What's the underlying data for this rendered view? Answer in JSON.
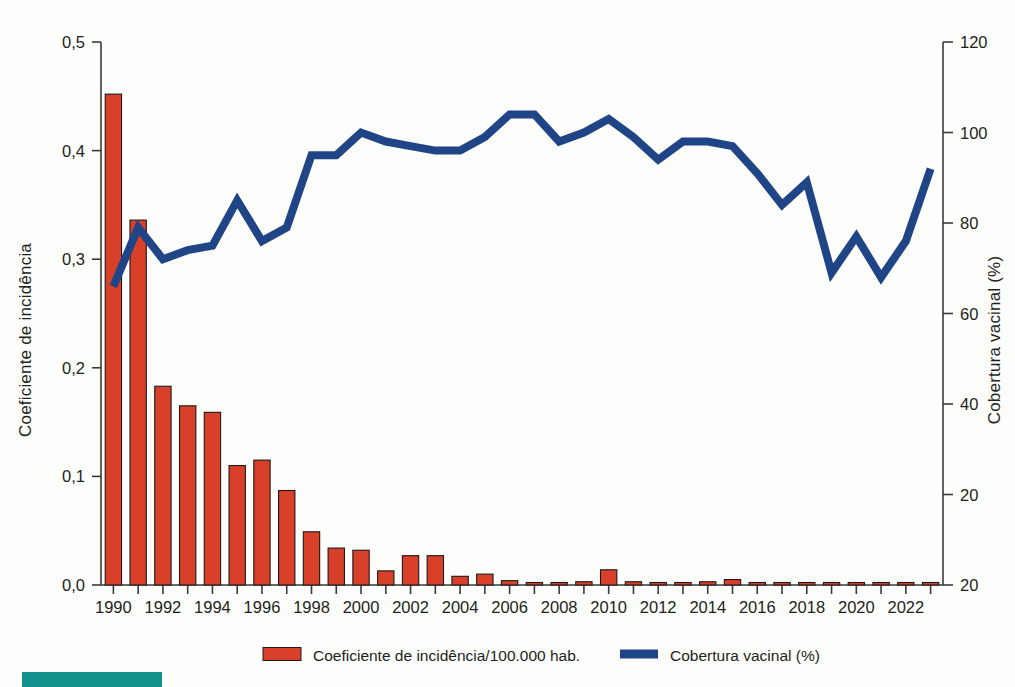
{
  "colors": {
    "bar": "#D8402A",
    "line": "#1F4587",
    "axis": "#3a3a3a",
    "text": "#231f20",
    "accent_teal": "#13918C",
    "background": "#fdfdfb"
  },
  "legend": {
    "position": "bottom",
    "items": [
      {
        "label": "Coeficiente de incidência/100.000 hab.",
        "type": "bar",
        "color": "#D8402A"
      },
      {
        "label": "Cobertura vacinal (%)",
        "type": "line",
        "color": "#1F4587"
      }
    ]
  },
  "chart_data": {
    "type": "bar",
    "title": "",
    "subtitle": "",
    "xlabel": "",
    "ylabel": "Coeficiente de incidência",
    "y2label": "Cobertura vacinal (%)",
    "grid": false,
    "ylim": [
      0.0,
      0.5
    ],
    "y2lim": [
      0,
      120
    ],
    "yticks": [
      0.0,
      0.1,
      0.2,
      0.3,
      0.4,
      0.5
    ],
    "ytick_labels": [
      "0,0",
      "0,1",
      "0,2",
      "0,3",
      "0,4",
      "0,5"
    ],
    "y2ticks": [
      0,
      20,
      40,
      60,
      80,
      100,
      120
    ],
    "y2tick_labels": [
      "20",
      "20",
      "40",
      "60",
      "80",
      "100",
      "120"
    ],
    "xlim": [
      1989.5,
      2023.5
    ],
    "categories": [
      1990,
      1991,
      1992,
      1993,
      1994,
      1995,
      1996,
      1997,
      1998,
      1999,
      2000,
      2001,
      2002,
      2003,
      2004,
      2005,
      2006,
      2007,
      2008,
      2009,
      2010,
      2011,
      2012,
      2013,
      2014,
      2015,
      2016,
      2017,
      2018,
      2019,
      2020,
      2021,
      2022,
      2023
    ],
    "xtick_labels": [
      "1990",
      "1992",
      "1994",
      "1996",
      "1998",
      "2000",
      "2002",
      "2004",
      "2006",
      "2008",
      "2010",
      "2012",
      "2014",
      "2016",
      "2018",
      "2020",
      "2022"
    ],
    "xtick_values": [
      1990,
      1992,
      1994,
      1996,
      1998,
      2000,
      2002,
      2004,
      2006,
      2008,
      2010,
      2012,
      2014,
      2016,
      2018,
      2020,
      2022
    ],
    "series": [
      {
        "name": "Coeficiente de incidência/100.000 hab.",
        "type": "bar",
        "axis": "left",
        "color": "#D8402A",
        "values": [
          0.452,
          0.336,
          0.183,
          0.165,
          0.159,
          0.11,
          0.115,
          0.087,
          0.049,
          0.034,
          0.032,
          0.013,
          0.027,
          0.027,
          0.008,
          0.01,
          0.004,
          0.002,
          0.002,
          0.003,
          0.014,
          0.003,
          0.0,
          0.002,
          0.003,
          0.005,
          0.002,
          0.001,
          0.001,
          0.002,
          0.001,
          0.0,
          0.0,
          0.002
        ]
      },
      {
        "name": "Cobertura vacinal (%)",
        "type": "line",
        "axis": "right",
        "color": "#1F4587",
        "values": [
          66,
          79,
          72,
          74,
          75,
          85,
          76,
          79,
          95,
          95,
          100,
          98,
          97,
          96,
          96,
          99,
          104,
          104,
          98,
          100,
          103,
          99,
          94,
          98,
          98,
          97,
          91,
          84,
          89,
          69,
          77,
          68,
          76,
          92
        ]
      }
    ],
    "annotations": []
  },
  "decor": {
    "teal_bar_label": "accent-bar"
  }
}
